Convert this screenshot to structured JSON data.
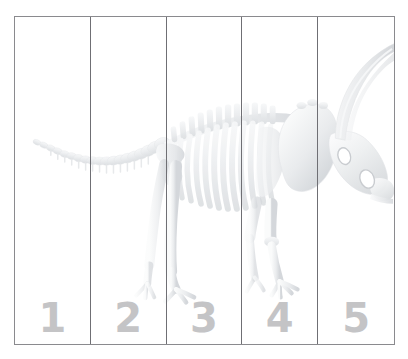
{
  "page": {
    "background_color": "#ffffff",
    "border_color": "#8a8a8e",
    "divider_color": "#6f6f74",
    "number_color": "#c4c4c6",
    "bone_color": "#eceef0"
  },
  "board": {
    "strips": [
      {
        "label": "1",
        "name": "strip-1"
      },
      {
        "label": "2",
        "name": "strip-2"
      },
      {
        "label": "3",
        "name": "strip-3"
      },
      {
        "label": "4",
        "name": "strip-4"
      },
      {
        "label": "5",
        "name": "strip-5"
      }
    ]
  },
  "artwork": {
    "subject": "dinosaur-skeleton",
    "species_style": "triceratops",
    "orientation": "facing-right",
    "parts": [
      "tail-vertebrae",
      "spine",
      "ribcage",
      "dorsal-spines",
      "pelvis",
      "hind-legs",
      "front-legs",
      "foot-toes",
      "shoulder-blade",
      "neck-frill",
      "skull",
      "eye-socket",
      "nostril-opening",
      "brow-horn",
      "beak"
    ]
  }
}
